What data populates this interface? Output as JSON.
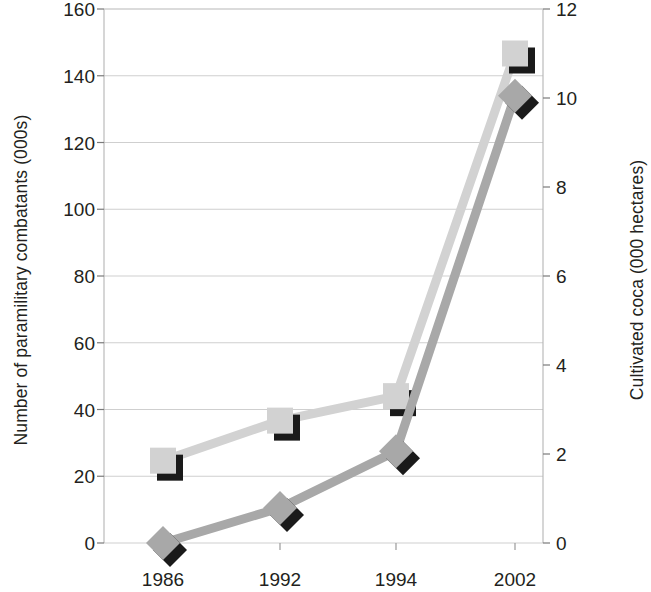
{
  "chart_data": {
    "type": "line",
    "title": "",
    "subtitle": "",
    "xlabel": "",
    "categories": [
      "1986",
      "1992",
      "1994",
      "2002"
    ],
    "grid": true,
    "legend": "none",
    "axes": {
      "left": {
        "label": "Number of paramilitary combatants (000s)",
        "ticks": [
          "0",
          "20",
          "40",
          "60",
          "80",
          "100",
          "120",
          "140",
          "160"
        ],
        "tick_values": [
          0,
          20,
          40,
          60,
          80,
          100,
          120,
          140,
          160
        ],
        "ylim": [
          0,
          160
        ]
      },
      "right": {
        "label": "Cultivated coca (000 hectares)",
        "ticks": [
          "0",
          "2",
          "4",
          "6",
          "8",
          "10",
          "12"
        ],
        "tick_values": [
          0,
          2,
          4,
          6,
          8,
          10,
          12
        ],
        "ylim": [
          0,
          12
        ]
      }
    },
    "series": [
      {
        "name": "Cultivated coca (000 hectares)",
        "axis": "right",
        "marker": "square",
        "color": "#d2d2d2",
        "shadow_color": "#1a1a1a",
        "values": [
          1.85,
          2.75,
          3.3,
          11.0
        ]
      },
      {
        "name": "Number of paramilitary combatants (000s)",
        "axis": "left",
        "marker": "diamond",
        "color": "#a8a8a8",
        "shadow_color": "#1a1a1a",
        "values": [
          0,
          10.5,
          27.5,
          134
        ]
      }
    ]
  },
  "style": {
    "grid_color": "#cfcfcf",
    "axis_color": "#b5b5b5",
    "text_color": "#231f20",
    "background": "#ffffff"
  }
}
